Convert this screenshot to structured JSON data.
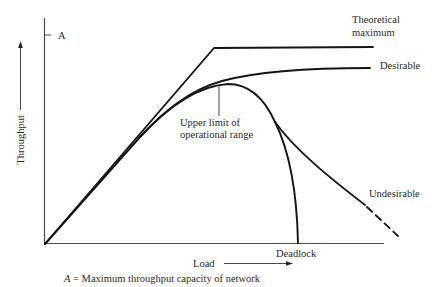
{
  "diagram": {
    "type": "throughput-vs-load",
    "axes": {
      "y_label": "Throughput",
      "x_label": "Load",
      "y_tick_label": "A"
    },
    "curves": [
      {
        "id": "theoretical",
        "label_line1": "Theoretical",
        "label_line2": "maximum",
        "style": "solid"
      },
      {
        "id": "desirable",
        "label": "Desirable",
        "style": "solid"
      },
      {
        "id": "undesirable",
        "label": "Undesirable",
        "style": "solid-then-dashed"
      },
      {
        "id": "deadlock",
        "label": "Deadlock",
        "style": "solid"
      }
    ],
    "annotation": {
      "line1": "Upper limit of",
      "line2": "operational range"
    },
    "caption_var": "A",
    "caption_rest": " = Maximum throughput capacity of network"
  }
}
